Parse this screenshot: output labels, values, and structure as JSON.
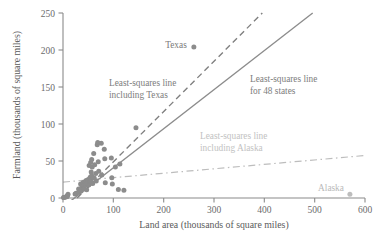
{
  "chart_data": {
    "type": "scatter",
    "title": "",
    "xlabel": "Land area (thousands of square miles)",
    "ylabel": "Farmland (thousands of square miles)",
    "xlim": [
      0,
      600
    ],
    "ylim": [
      0,
      250
    ],
    "xticks": [
      0,
      100,
      200,
      300,
      400,
      500,
      600
    ],
    "yticks": [
      0,
      50,
      100,
      150,
      200,
      250
    ],
    "grid": false,
    "legend_position": "inline-annotations",
    "x": [
      1,
      2,
      5,
      7,
      8,
      9,
      10,
      24,
      26,
      31,
      32,
      35,
      36,
      37,
      40,
      41,
      42,
      44,
      45,
      46,
      47,
      48,
      50,
      51,
      52,
      53,
      54,
      55,
      55,
      56,
      56,
      57,
      57,
      58,
      59,
      61,
      62,
      63,
      65,
      66,
      68,
      69,
      70,
      71,
      76,
      77,
      82,
      83,
      84,
      96,
      97,
      98,
      104,
      110,
      113,
      121,
      145,
      260,
      570
    ],
    "y": [
      0.6,
      0.8,
      1.2,
      1.6,
      2.0,
      3.5,
      5.0,
      5.5,
      6.5,
      12.0,
      8.0,
      19.0,
      9.5,
      14.0,
      21.0,
      16.5,
      13.0,
      22.0,
      18.0,
      23.5,
      11.0,
      20.0,
      25.0,
      17.5,
      44.0,
      24.0,
      28.0,
      48.0,
      26.0,
      35.0,
      21.5,
      52.0,
      30.0,
      42.0,
      19.5,
      60.0,
      27.0,
      45.0,
      33.0,
      23.0,
      72.0,
      75.0,
      49.0,
      36.0,
      74.0,
      31.0,
      66.0,
      53.0,
      20.5,
      54.0,
      27.5,
      19.0,
      42.0,
      11.5,
      46.0,
      10.5,
      95.0,
      204.0,
      5.0
    ],
    "labeled_points": [
      {
        "name": "Texas",
        "x": 260,
        "y": 204,
        "label_x": 225,
        "label_y": 216,
        "style": "dark"
      },
      {
        "name": "Alaska",
        "x": 570,
        "y": 5,
        "label_x": 520,
        "label_y": 14,
        "style": "faint"
      }
    ],
    "fit_lines": [
      {
        "name": "least-squares-line-for-48-states",
        "label": "Least-squares line\nfor 48 states",
        "label_line1": "Least-squares line",
        "label_line2": "for 48 states",
        "style": "solid",
        "color": "#8c8c8c",
        "x1": 0,
        "y1": -12,
        "x2": 496,
        "y2": 250,
        "label_x": 255,
        "label_y": 177
      },
      {
        "name": "least-squares-line-including-texas",
        "label": "Least-squares line\nincluding Texas",
        "label_line1": "Least-squares line",
        "label_line2": "including Texas",
        "style": "dashed",
        "color": "#7f7f7f",
        "x1": 28,
        "y1": 0,
        "x2": 396,
        "y2": 250,
        "label_x": 92,
        "label_y": 166
      },
      {
        "name": "least-squares-line-including-alaska",
        "label": "Least-squares line\nincluding Alaska",
        "label_line1": "Least-squares line",
        "label_line2": "including Alaska",
        "style": "dash-dot",
        "color": "#bdbdbd",
        "x1": 0,
        "y1": 21.5,
        "x2": 600,
        "y2": 57.5,
        "label_x": 272,
        "label_y": 100
      }
    ],
    "colors": {
      "point": "#8c8c8c",
      "point_faint": "#bdbdbd",
      "axis": "#8a8a8a",
      "text": "#6b6b6b",
      "text_faint": "#c2c2c2"
    }
  }
}
